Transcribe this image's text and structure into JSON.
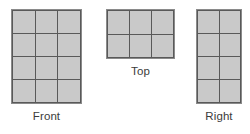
{
  "figure": {
    "background_color": "#ffffff",
    "cell_fill_color": "#c9c9c9",
    "grid_line_color": "#595959",
    "border_color": "#8a8a8a",
    "label_color": "#3b3b3b"
  },
  "views": [
    {
      "id": "front",
      "label": "Front",
      "columns": 3,
      "rows": 4,
      "cell_count": 12
    },
    {
      "id": "top",
      "label": "Top",
      "columns": 3,
      "rows": 2,
      "cell_count": 6
    },
    {
      "id": "right",
      "label": "Right",
      "columns": 2,
      "rows": 4,
      "cell_count": 8
    }
  ]
}
